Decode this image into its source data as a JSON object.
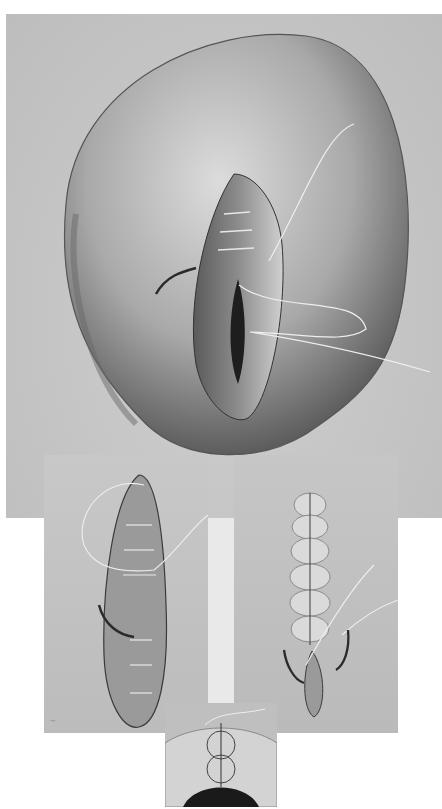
{
  "figure": {
    "type": "grayscale surgical illustration",
    "panels": [
      {
        "id": "top",
        "description": "large oval organ with elliptical incision being sutured, threads and curved needle"
      },
      {
        "id": "lower-left",
        "description": "elongated incision with layered sutures and curved needle"
      },
      {
        "id": "lower-right",
        "description": "closed incision with row of sutures, two curved needles at lower end"
      },
      {
        "id": "inset",
        "description": "cross-section showing figure-of-eight suture through tissue layer"
      }
    ],
    "signature": "illegible artist signature",
    "palette": {
      "paper": "#ffffff",
      "background": "#c4c4c4",
      "shadow": "#4a4a4a",
      "highlight": "#e6e6e6"
    }
  }
}
